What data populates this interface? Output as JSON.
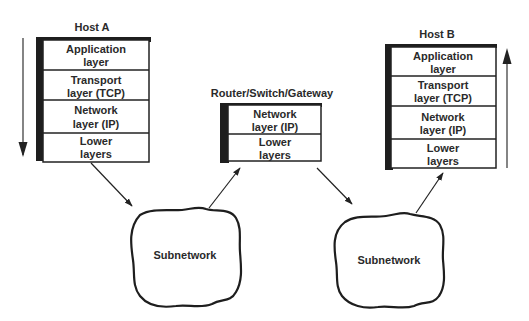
{
  "diagram": {
    "type": "protocol-stack-network",
    "nodes": {
      "host_a": {
        "title": "Host A",
        "layers": [
          [
            "Application",
            "layer"
          ],
          [
            "Transport",
            "layer (TCP)"
          ],
          [
            "Network",
            "layer (IP)"
          ],
          [
            "Lower",
            "layers"
          ]
        ],
        "flow_direction": "down"
      },
      "router": {
        "title": "Router/Switch/Gateway",
        "layers": [
          [
            "Network",
            "layer (IP)"
          ],
          [
            "Lower",
            "layers"
          ]
        ]
      },
      "host_b": {
        "title": "Host B",
        "layers": [
          [
            "Application",
            "layer"
          ],
          [
            "Transport",
            "layer (TCP)"
          ],
          [
            "Network",
            "layer (IP)"
          ],
          [
            "Lower",
            "layers"
          ]
        ],
        "flow_direction": "up"
      }
    },
    "subnetworks": [
      {
        "label": "Subnetwork"
      },
      {
        "label": "Subnetwork"
      }
    ],
    "edges": [
      {
        "from": "Host A",
        "to": "Subnetwork 1"
      },
      {
        "from": "Subnetwork 1",
        "to": "Router/Switch/Gateway"
      },
      {
        "from": "Router/Switch/Gateway",
        "to": "Subnetwork 2"
      },
      {
        "from": "Subnetwork 2",
        "to": "Host B"
      }
    ],
    "colors": {
      "ink": "#222222",
      "background": "#ffffff"
    }
  }
}
